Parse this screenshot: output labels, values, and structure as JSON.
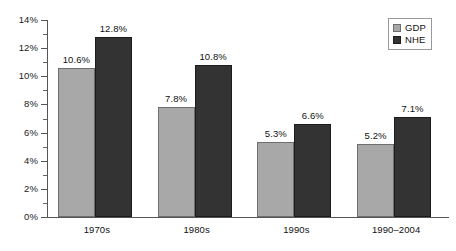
{
  "chart_data": {
    "type": "bar",
    "title": "",
    "subtitle": "",
    "xlabel": "",
    "ylabel": "",
    "categories": [
      "1970s",
      "1980s",
      "1990s",
      "1990–2004"
    ],
    "series": [
      {
        "name": "GDP",
        "color": "#a8a8a8",
        "values": [
          10.6,
          7.8,
          5.3,
          5.2
        ],
        "labels": [
          "10.6%",
          "7.8%",
          "5.3%",
          "5.2%"
        ]
      },
      {
        "name": "NHE",
        "color": "#333333",
        "values": [
          12.8,
          10.8,
          6.6,
          7.1
        ],
        "labels": [
          "12.8%",
          "10.8%",
          "6.6%",
          "7.1%"
        ]
      }
    ],
    "ylim": [
      0,
      14
    ],
    "ytick_values": [
      0,
      2,
      4,
      6,
      8,
      10,
      12,
      14
    ],
    "ytick_labels": [
      "0%",
      "2%",
      "4%",
      "6%",
      "8%",
      "10%",
      "12%",
      "14%"
    ],
    "yminor_values": [
      1,
      3,
      5,
      7,
      9,
      11,
      13
    ],
    "grid": false,
    "legend_position": "top-right",
    "legend_entries": [
      "GDP",
      "NHE"
    ],
    "value_labels_shown": true,
    "background_color": "#ffffff",
    "axis_color": "#555555"
  }
}
